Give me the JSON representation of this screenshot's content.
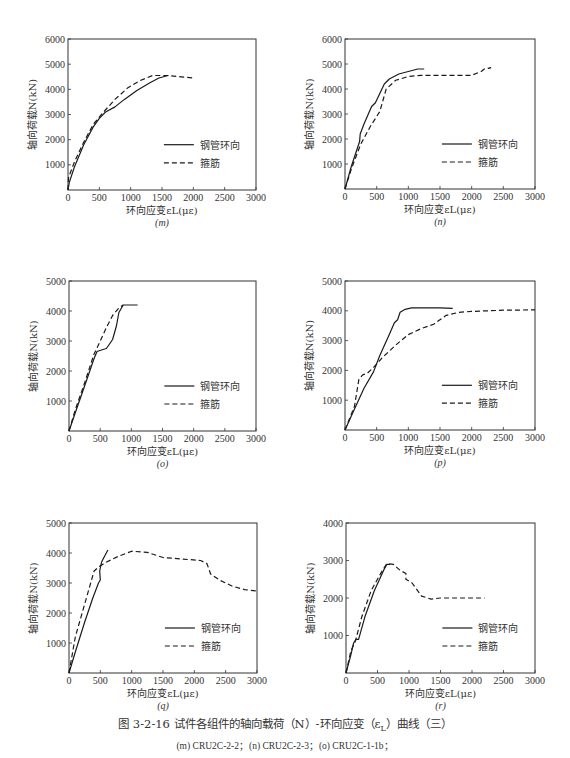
{
  "figure": {
    "caption": "图 3-2-16   试件各组件的轴向载荷（N）-环向应变（ε",
    "caption_sub": "L",
    "caption_end": "）曲线（三）",
    "subcaption": "(m) CRU2C-2-2；(n) CRU2C-2-3；(o) CRU2C-1-1b；"
  },
  "legend": {
    "solid": "钢管环向",
    "dashed": "箍筋"
  },
  "colors": {
    "line": "#1a1a1a",
    "frame": "#333333",
    "background": "#ffffff"
  },
  "chart_data": [
    {
      "id": "m",
      "label": "(m)",
      "type": "line",
      "xlabel": "环向应变εL(με)",
      "ylabel": "轴向荷载N(kN)",
      "xlim": [
        0,
        3000
      ],
      "ylim": [
        0,
        6000
      ],
      "xticks": [
        0,
        500,
        1000,
        1500,
        2000,
        2500,
        3000
      ],
      "yticks": [
        1000,
        2000,
        3000,
        4000,
        5000,
        6000
      ],
      "box": [
        68,
        39,
        256,
        190
      ],
      "series": [
        {
          "name": "钢管环向",
          "style": "solid",
          "points": [
            [
              0,
              0
            ],
            [
              20,
              300
            ],
            [
              100,
              900
            ],
            [
              250,
              1800
            ],
            [
              400,
              2500
            ],
            [
              500,
              2850
            ],
            [
              600,
              3100
            ],
            [
              750,
              3300
            ],
            [
              900,
              3600
            ],
            [
              1100,
              3950
            ],
            [
              1300,
              4250
            ],
            [
              1450,
              4450
            ],
            [
              1600,
              4550
            ]
          ]
        },
        {
          "name": "箍筋",
          "style": "dashed",
          "points": [
            [
              0,
              0
            ],
            [
              10,
              500
            ],
            [
              100,
              1100
            ],
            [
              250,
              1900
            ],
            [
              400,
              2600
            ],
            [
              550,
              3050
            ],
            [
              750,
              3600
            ],
            [
              950,
              4050
            ],
            [
              1150,
              4350
            ],
            [
              1350,
              4550
            ],
            [
              1600,
              4550
            ],
            [
              1800,
              4500
            ],
            [
              2000,
              4450
            ]
          ]
        }
      ]
    },
    {
      "id": "n",
      "label": "(n)",
      "type": "line",
      "xlabel": "环向应变εL(με)",
      "ylabel": "轴向荷载N(kN)",
      "xlim": [
        0,
        3000
      ],
      "ylim": [
        0,
        6000
      ],
      "xticks": [
        0,
        500,
        1000,
        1500,
        2000,
        2500,
        3000
      ],
      "yticks": [
        1000,
        2000,
        3000,
        4000,
        5000,
        6000
      ],
      "box": [
        345,
        39,
        535,
        189
      ],
      "series": [
        {
          "name": "钢管环向",
          "style": "solid",
          "points": [
            [
              0,
              0
            ],
            [
              100,
              900
            ],
            [
              230,
              1900
            ],
            [
              240,
              2200
            ],
            [
              300,
              2600
            ],
            [
              420,
              3300
            ],
            [
              480,
              3450
            ],
            [
              620,
              4200
            ],
            [
              700,
              4400
            ],
            [
              850,
              4600
            ],
            [
              1000,
              4700
            ],
            [
              1150,
              4800
            ],
            [
              1250,
              4800
            ]
          ]
        },
        {
          "name": "箍筋",
          "style": "dashed",
          "points": [
            [
              0,
              0
            ],
            [
              100,
              800
            ],
            [
              250,
              1800
            ],
            [
              400,
              2500
            ],
            [
              550,
              3100
            ],
            [
              650,
              4000
            ],
            [
              800,
              4350
            ],
            [
              1000,
              4500
            ],
            [
              1200,
              4550
            ],
            [
              1500,
              4550
            ],
            [
              1800,
              4550
            ],
            [
              2000,
              4550
            ],
            [
              2150,
              4700
            ],
            [
              2200,
              4800
            ],
            [
              2300,
              4850
            ],
            [
              2250,
              4800
            ]
          ]
        }
      ]
    },
    {
      "id": "o",
      "label": "(o)",
      "type": "line",
      "xlabel": "环向应变εL(με)",
      "ylabel": "轴向荷载N(kN)",
      "xlim": [
        0,
        3000
      ],
      "ylim": [
        0,
        5000
      ],
      "xticks": [
        0,
        500,
        1000,
        1500,
        2000,
        2500,
        3000
      ],
      "yticks": [
        1000,
        2000,
        3000,
        4000,
        5000
      ],
      "box": [
        69,
        281,
        256,
        431
      ],
      "series": [
        {
          "name": "钢管环向",
          "style": "solid",
          "points": [
            [
              0,
              0
            ],
            [
              100,
              600
            ],
            [
              250,
              1500
            ],
            [
              400,
              2400
            ],
            [
              450,
              2650
            ],
            [
              520,
              2700
            ],
            [
              600,
              2750
            ],
            [
              700,
              3050
            ],
            [
              760,
              3500
            ],
            [
              800,
              3950
            ],
            [
              870,
              4200
            ],
            [
              950,
              4200
            ],
            [
              1100,
              4200
            ]
          ]
        },
        {
          "name": "箍筋",
          "style": "dashed",
          "points": [
            [
              0,
              0
            ],
            [
              100,
              700
            ],
            [
              250,
              1600
            ],
            [
              400,
              2550
            ],
            [
              500,
              3000
            ],
            [
              600,
              3450
            ],
            [
              700,
              3850
            ],
            [
              800,
              4100
            ],
            [
              870,
              4200
            ]
          ]
        }
      ]
    },
    {
      "id": "p",
      "label": "(p)",
      "type": "line",
      "xlabel": "环向应变εL(με)",
      "ylabel": "轴向荷载N(kN)",
      "xlim": [
        0,
        3000
      ],
      "ylim": [
        0,
        5000
      ],
      "xticks": [
        0,
        500,
        1000,
        1500,
        2000,
        2500,
        3000
      ],
      "yticks": [
        1000,
        2000,
        3000,
        4000,
        5000
      ],
      "box": [
        345,
        281,
        535,
        430
      ],
      "series": [
        {
          "name": "钢管环向",
          "style": "solid",
          "points": [
            [
              0,
              0
            ],
            [
              150,
              700
            ],
            [
              300,
              1400
            ],
            [
              450,
              1950
            ],
            [
              550,
              2500
            ],
            [
              700,
              3200
            ],
            [
              780,
              3600
            ],
            [
              830,
              3700
            ],
            [
              870,
              3950
            ],
            [
              950,
              4050
            ],
            [
              1050,
              4100
            ],
            [
              1300,
              4100
            ],
            [
              1500,
              4100
            ],
            [
              1700,
              4080
            ]
          ]
        },
        {
          "name": "箍筋",
          "style": "dashed",
          "points": [
            [
              0,
              0
            ],
            [
              150,
              800
            ],
            [
              220,
              1700
            ],
            [
              280,
              1850
            ],
            [
              350,
              1900
            ],
            [
              450,
              2100
            ],
            [
              600,
              2450
            ],
            [
              800,
              2850
            ],
            [
              1000,
              3200
            ],
            [
              1200,
              3400
            ],
            [
              1400,
              3550
            ],
            [
              1600,
              3850
            ],
            [
              1800,
              3950
            ],
            [
              2000,
              3980
            ],
            [
              2500,
              4020
            ],
            [
              3000,
              4030
            ]
          ]
        }
      ]
    },
    {
      "id": "q",
      "label": "(q)",
      "type": "line",
      "xlabel": "环向应变εL(με)",
      "ylabel": "轴向荷载N(kN)",
      "xlim": [
        0,
        3000
      ],
      "ylim": [
        0,
        5000
      ],
      "xticks": [
        0,
        500,
        1000,
        1500,
        2000,
        2500,
        3000
      ],
      "yticks": [
        1000,
        2000,
        3000,
        4000,
        5000
      ],
      "box": [
        69,
        523,
        257,
        673
      ],
      "series": [
        {
          "name": "钢管环向",
          "style": "solid",
          "points": [
            [
              0,
              0
            ],
            [
              100,
              700
            ],
            [
              250,
              1700
            ],
            [
              380,
              2500
            ],
            [
              470,
              3000
            ],
            [
              500,
              3100
            ],
            [
              490,
              3400
            ],
            [
              520,
              3700
            ],
            [
              570,
              3900
            ],
            [
              620,
              4100
            ]
          ]
        },
        {
          "name": "箍筋",
          "style": "dashed",
          "points": [
            [
              0,
              0
            ],
            [
              100,
              1200
            ],
            [
              250,
              2300
            ],
            [
              400,
              3400
            ],
            [
              480,
              3550
            ],
            [
              600,
              3700
            ],
            [
              800,
              3900
            ],
            [
              1000,
              4060
            ],
            [
              1250,
              4020
            ],
            [
              1500,
              3850
            ],
            [
              1800,
              3800
            ],
            [
              2100,
              3750
            ],
            [
              2200,
              3650
            ],
            [
              2260,
              3300
            ],
            [
              2400,
              3100
            ],
            [
              2600,
              2900
            ],
            [
              2800,
              2780
            ],
            [
              3000,
              2730
            ]
          ]
        }
      ]
    },
    {
      "id": "r",
      "label": "(r)",
      "type": "line",
      "xlabel": "环向应变εL(με)",
      "ylabel": "轴向荷载N(kN)",
      "xlim": [
        0,
        3000
      ],
      "ylim": [
        0,
        4000
      ],
      "xticks": [
        0,
        500,
        1000,
        1500,
        2000,
        2500,
        3000
      ],
      "yticks": [
        1000,
        2000,
        3000,
        4000
      ],
      "box": [
        346,
        523,
        535,
        673
      ],
      "series": [
        {
          "name": "钢管环向",
          "style": "solid",
          "points": [
            [
              0,
              0
            ],
            [
              80,
              500
            ],
            [
              120,
              800
            ],
            [
              160,
              900
            ],
            [
              200,
              900
            ],
            [
              300,
              1500
            ],
            [
              450,
              2200
            ],
            [
              600,
              2750
            ],
            [
              650,
              2900
            ],
            [
              700,
              2900
            ]
          ]
        },
        {
          "name": "箍筋",
          "style": "dashed",
          "points": [
            [
              0,
              0
            ],
            [
              80,
              600
            ],
            [
              150,
              850
            ],
            [
              250,
              1500
            ],
            [
              400,
              2200
            ],
            [
              550,
              2650
            ],
            [
              650,
              2920
            ],
            [
              750,
              2900
            ],
            [
              850,
              2750
            ],
            [
              950,
              2650
            ],
            [
              950,
              2500
            ],
            [
              1050,
              2400
            ],
            [
              1200,
              2050
            ],
            [
              1350,
              1970
            ],
            [
              1500,
              2000
            ],
            [
              2200,
              2000
            ]
          ]
        }
      ]
    }
  ]
}
